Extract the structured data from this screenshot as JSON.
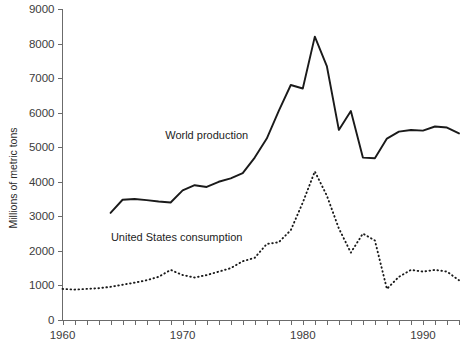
{
  "chart_data": {
    "type": "line",
    "title": "",
    "xlabel": "",
    "ylabel": "Millions of metric tons",
    "xlim": [
      1960,
      1993
    ],
    "ylim": [
      0,
      9000
    ],
    "grid": false,
    "legend": "inline-annotations",
    "y_ticks": [
      0,
      1000,
      2000,
      3000,
      4000,
      5000,
      6000,
      7000,
      8000,
      9000
    ],
    "y_tick_labels": [
      "0",
      "1000",
      "2000",
      "3000",
      "4000",
      "5000",
      "6000",
      "7000",
      "8000",
      "9000"
    ],
    "x_ticks": [
      1960,
      1961,
      1962,
      1963,
      1964,
      1965,
      1966,
      1967,
      1968,
      1969,
      1970,
      1971,
      1972,
      1973,
      1974,
      1975,
      1976,
      1977,
      1978,
      1979,
      1980,
      1981,
      1982,
      1983,
      1984,
      1985,
      1986,
      1987,
      1988,
      1989,
      1990,
      1991,
      1992,
      1993
    ],
    "x_tick_labels_shown": [
      "1960",
      "1970",
      "1980",
      "1990"
    ],
    "x_tick_labels_shown_at": [
      1960,
      1970,
      1980,
      1990
    ],
    "series": [
      {
        "name": "World production",
        "style": "solid",
        "label_x": 1972.0,
        "label_y": 5250,
        "x": [
          1964,
          1965,
          1966,
          1967,
          1968,
          1969,
          1970,
          1971,
          1972,
          1973,
          1974,
          1975,
          1976,
          1977,
          1978,
          1979,
          1980,
          1981,
          1982,
          1983,
          1984,
          1985,
          1986,
          1987,
          1988,
          1989,
          1990,
          1991,
          1992,
          1993
        ],
        "values": [
          3100,
          3480,
          3500,
          3470,
          3430,
          3400,
          3750,
          3900,
          3850,
          4000,
          4100,
          4250,
          4700,
          5250,
          6050,
          6800,
          6700,
          8200,
          7350,
          5500,
          6050,
          4700,
          4680,
          5250,
          5450,
          5500,
          5480,
          5600,
          5570,
          5400
        ]
      },
      {
        "name": "United States consumption",
        "style": "dotted",
        "label_x": 1969.5,
        "label_y": 2300,
        "x": [
          1960,
          1961,
          1962,
          1963,
          1964,
          1965,
          1966,
          1967,
          1968,
          1969,
          1970,
          1971,
          1972,
          1973,
          1974,
          1975,
          1976,
          1977,
          1978,
          1979,
          1980,
          1981,
          1982,
          1983,
          1984,
          1985,
          1986,
          1987,
          1988,
          1989,
          1990,
          1991,
          1992,
          1993
        ],
        "values": [
          900,
          880,
          900,
          920,
          960,
          1020,
          1080,
          1150,
          1250,
          1450,
          1300,
          1230,
          1300,
          1400,
          1500,
          1700,
          1800,
          2200,
          2250,
          2600,
          3400,
          4300,
          3600,
          2650,
          1950,
          2500,
          2300,
          900,
          1250,
          1450,
          1400,
          1450,
          1400,
          1150
        ]
      }
    ]
  },
  "axis": {
    "y_title": "Millions of metric tons"
  },
  "annotations": {
    "world_production_label": "World production",
    "us_consumption_label": "United States consumption"
  }
}
